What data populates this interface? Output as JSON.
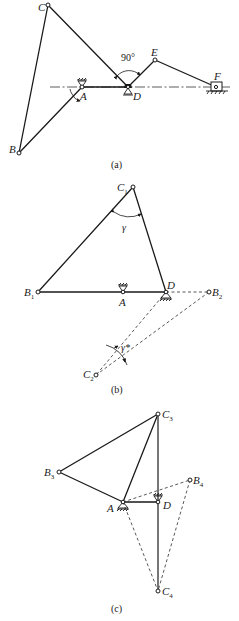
{
  "figure": {
    "panels": [
      {
        "id": "a",
        "caption": "(a)",
        "labels": {
          "C": "C",
          "B": "B",
          "A": "A",
          "D": "D",
          "E": "E",
          "F": "F"
        },
        "angle_label": "90°"
      },
      {
        "id": "b",
        "caption": "(b)",
        "labels": {
          "C1": {
            "base": "C",
            "sub": "1"
          },
          "B1": {
            "base": "B",
            "sub": "1"
          },
          "A": "A",
          "D": "D",
          "B2": {
            "base": "B",
            "sub": "2"
          },
          "C2": {
            "base": "C",
            "sub": "2"
          }
        },
        "angle_label_gamma": "γ",
        "angle_label_gamma_star": "γ*"
      },
      {
        "id": "c",
        "caption": "(c)",
        "labels": {
          "C3": {
            "base": "C",
            "sub": "3"
          },
          "B3": {
            "base": "B",
            "sub": "3"
          },
          "A": "A",
          "D": "D",
          "B4": {
            "base": "B",
            "sub": "4"
          },
          "C4": {
            "base": "C",
            "sub": "4"
          }
        }
      }
    ]
  }
}
